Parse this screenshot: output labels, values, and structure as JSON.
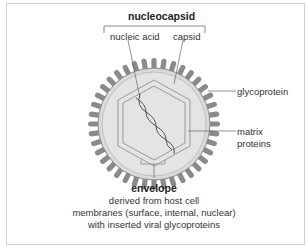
{
  "diagram": {
    "title_top": "nucleocapsid",
    "labels": {
      "nucleic_acid": "nucleic acid",
      "capsid": "capsid",
      "glycoprotein": "glycoprotein",
      "matrix_proteins_line1": "matrix",
      "matrix_proteins_line2": "proteins"
    },
    "envelope": {
      "title": "envelope",
      "line1": "derived  from host cell",
      "line2": "membranes (surface, internal, nuclear)",
      "line3": "with inserted viral glycoproteins"
    },
    "colors": {
      "spike": "#8a8a8a",
      "envelope_fill": "#d9d9d9",
      "text": "#333333"
    }
  }
}
